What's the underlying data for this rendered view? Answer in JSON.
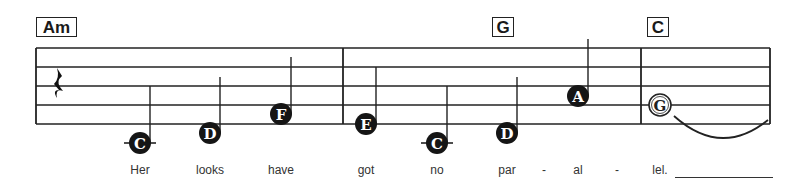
{
  "chords": [
    {
      "label": "Am",
      "x": 36,
      "width": 41
    },
    {
      "label": "G",
      "x": 492,
      "width": 22
    },
    {
      "label": "C",
      "x": 647,
      "width": 22
    }
  ],
  "staff": {
    "left": 36,
    "right": 770,
    "top": 48,
    "line_spacing": 19,
    "barlines": [
      343,
      641
    ],
    "line_color": "#222222"
  },
  "rest": {
    "type": "quarter-rest",
    "x": 58,
    "y": 86
  },
  "notes": [
    {
      "name": "C",
      "x": 140,
      "y": 143,
      "filled": true,
      "ledger": true,
      "stem_top": 86
    },
    {
      "name": "D",
      "x": 210,
      "y": 133,
      "filled": true,
      "ledger": false,
      "stem_top": 77
    },
    {
      "name": "F",
      "x": 281,
      "y": 114,
      "filled": true,
      "ledger": false,
      "stem_top": 57
    },
    {
      "name": "E",
      "x": 366,
      "y": 124,
      "filled": true,
      "ledger": false,
      "stem_top": 67
    },
    {
      "name": "C",
      "x": 437,
      "y": 143,
      "filled": true,
      "ledger": true,
      "stem_top": 86
    },
    {
      "name": "D",
      "x": 507,
      "y": 133,
      "filled": true,
      "ledger": false,
      "stem_top": 77
    },
    {
      "name": "A",
      "x": 578,
      "y": 96,
      "filled": true,
      "ledger": false,
      "stem_top": 39
    },
    {
      "name": "G",
      "x": 660,
      "y": 105,
      "filled": false,
      "ledger": false,
      "stem_top": null
    }
  ],
  "tie": {
    "from_x": 674,
    "to_x": 768,
    "y": 114,
    "depth": 20
  },
  "lyrics": [
    {
      "text": "Her",
      "x": 140
    },
    {
      "text": "looks",
      "x": 210
    },
    {
      "text": "have",
      "x": 281
    },
    {
      "text": "got",
      "x": 366
    },
    {
      "text": "no",
      "x": 437
    },
    {
      "text": "par",
      "x": 507
    },
    {
      "text": "-",
      "x": 544
    },
    {
      "text": "al",
      "x": 578
    },
    {
      "text": "-",
      "x": 617
    },
    {
      "text": "lel.",
      "x": 660
    }
  ],
  "extender": {
    "x": 675,
    "width": 98
  }
}
